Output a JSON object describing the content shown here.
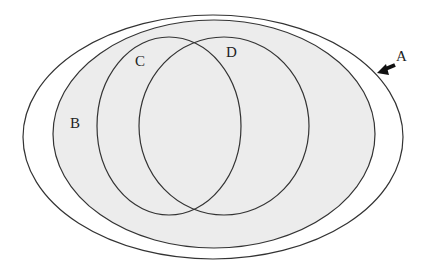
{
  "diagram": {
    "type": "venn-nested-sets",
    "sets": [
      {
        "id": "A",
        "label": "A",
        "shape": "ellipse",
        "cx": 213,
        "cy": 137,
        "rx": 190,
        "ry": 122,
        "fill": "#ffffff"
      },
      {
        "id": "B",
        "label": "B",
        "shape": "ellipse",
        "cx": 214,
        "cy": 134,
        "rx": 161,
        "ry": 114,
        "fill": "#ececec"
      },
      {
        "id": "C",
        "label": "C",
        "shape": "ellipse",
        "cx": 169,
        "cy": 126,
        "rx": 72,
        "ry": 89
      },
      {
        "id": "D",
        "label": "D",
        "shape": "ellipse",
        "cx": 224,
        "cy": 126,
        "rx": 85,
        "ry": 89
      }
    ],
    "labels": {
      "A": "A",
      "B": "B",
      "C": "C",
      "D": "D"
    },
    "arrow": {
      "target": "A",
      "from": [
        395,
        65
      ],
      "to": [
        377,
        73
      ],
      "color": "#111111"
    },
    "stroke_color": "#333333",
    "shade_color": "#ececec"
  }
}
